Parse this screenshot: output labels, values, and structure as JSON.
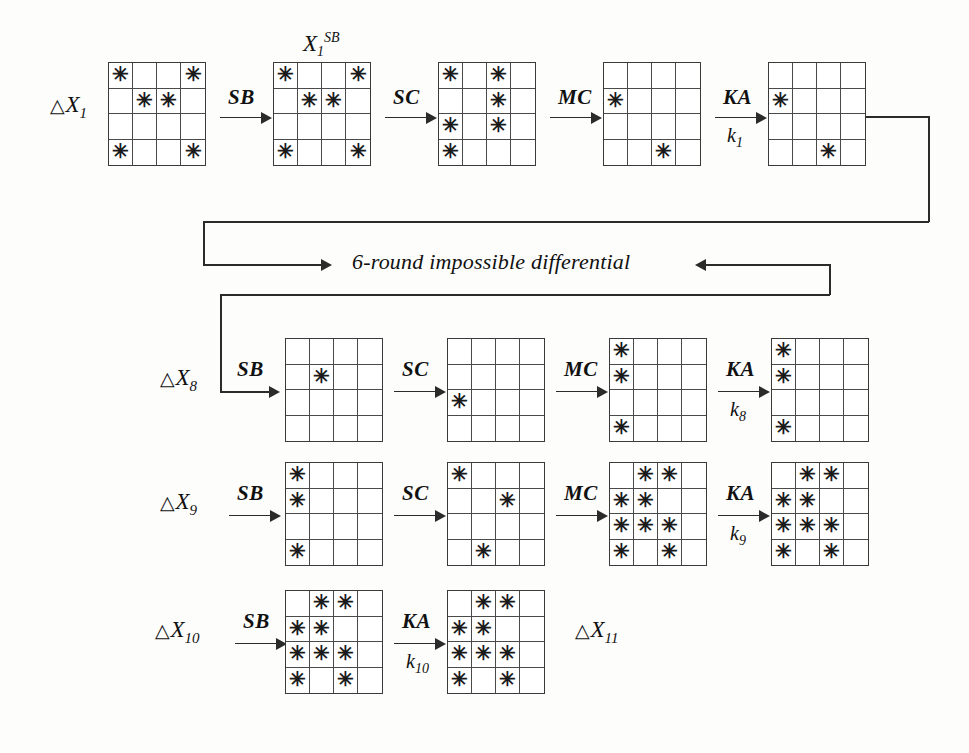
{
  "diagram": {
    "star_glyph": "✳",
    "middle_note": "6-round impossible differential",
    "rows": [
      {
        "id": "row-1",
        "input_label": {
          "delta": "△",
          "base": "X",
          "sub": "1"
        },
        "grid_label": {
          "base": "X",
          "sub": "1",
          "sup": "SB"
        },
        "steps": [
          {
            "op": "SB",
            "key": ""
          },
          {
            "op": "SC",
            "key": ""
          },
          {
            "op": "MC",
            "key": ""
          },
          {
            "op": "KA",
            "key": "k",
            "key_sub": "1"
          }
        ],
        "grids": [
          {
            "name": "grid-dx1",
            "cells": [
              1,
              0,
              0,
              1,
              0,
              1,
              1,
              0,
              0,
              0,
              0,
              0,
              1,
              0,
              0,
              1
            ]
          },
          {
            "name": "grid-x1sb",
            "cells": [
              1,
              0,
              0,
              1,
              0,
              1,
              1,
              0,
              0,
              0,
              0,
              0,
              1,
              0,
              0,
              1
            ]
          },
          {
            "name": "grid-r1-sc",
            "cells": [
              1,
              0,
              1,
              0,
              0,
              0,
              1,
              0,
              1,
              0,
              1,
              0,
              1,
              0,
              0,
              0
            ]
          },
          {
            "name": "grid-r1-mc",
            "cells": [
              0,
              0,
              0,
              0,
              1,
              0,
              0,
              0,
              0,
              0,
              0,
              0,
              0,
              0,
              1,
              0
            ]
          },
          {
            "name": "grid-r1-ka",
            "cells": [
              0,
              0,
              0,
              0,
              1,
              0,
              0,
              0,
              0,
              0,
              0,
              0,
              0,
              0,
              1,
              0
            ]
          }
        ]
      },
      {
        "id": "row-8",
        "input_label": {
          "delta": "△",
          "base": "X",
          "sub": "8"
        },
        "grid_label": null,
        "steps": [
          {
            "op": "SB",
            "key": ""
          },
          {
            "op": "SC",
            "key": ""
          },
          {
            "op": "MC",
            "key": ""
          },
          {
            "op": "KA",
            "key": "k",
            "key_sub": "8"
          }
        ],
        "grids": [
          {
            "name": "grid-r8-sb",
            "cells": [
              0,
              0,
              0,
              0,
              0,
              1,
              0,
              0,
              0,
              0,
              0,
              0,
              0,
              0,
              0,
              0
            ]
          },
          {
            "name": "grid-r8-sc",
            "cells": [
              0,
              0,
              0,
              0,
              0,
              0,
              0,
              0,
              1,
              0,
              0,
              0,
              0,
              0,
              0,
              0
            ]
          },
          {
            "name": "grid-r8-mc",
            "cells": [
              1,
              0,
              0,
              0,
              1,
              0,
              0,
              0,
              0,
              0,
              0,
              0,
              1,
              0,
              0,
              0
            ]
          },
          {
            "name": "grid-r8-ka",
            "cells": [
              1,
              0,
              0,
              0,
              1,
              0,
              0,
              0,
              0,
              0,
              0,
              0,
              1,
              0,
              0,
              0
            ]
          }
        ]
      },
      {
        "id": "row-9",
        "input_label": {
          "delta": "△",
          "base": "X",
          "sub": "9"
        },
        "grid_label": null,
        "steps": [
          {
            "op": "SB",
            "key": ""
          },
          {
            "op": "SC",
            "key": ""
          },
          {
            "op": "MC",
            "key": ""
          },
          {
            "op": "KA",
            "key": "k",
            "key_sub": "9"
          }
        ],
        "grids": [
          {
            "name": "grid-r9-sb",
            "cells": [
              1,
              0,
              0,
              0,
              1,
              0,
              0,
              0,
              0,
              0,
              0,
              0,
              1,
              0,
              0,
              0
            ]
          },
          {
            "name": "grid-r9-sc",
            "cells": [
              1,
              0,
              0,
              0,
              0,
              0,
              1,
              0,
              0,
              0,
              0,
              0,
              0,
              1,
              0,
              0
            ]
          },
          {
            "name": "grid-r9-mc",
            "cells": [
              0,
              1,
              1,
              0,
              1,
              1,
              0,
              0,
              1,
              1,
              1,
              0,
              1,
              0,
              1,
              0
            ]
          },
          {
            "name": "grid-r9-ka",
            "cells": [
              0,
              1,
              1,
              0,
              1,
              1,
              0,
              0,
              1,
              1,
              1,
              0,
              1,
              0,
              1,
              0
            ]
          }
        ]
      },
      {
        "id": "row-10",
        "input_label": {
          "delta": "△",
          "base": "X",
          "sub": "10"
        },
        "grid_label": null,
        "output_label": {
          "delta": "△",
          "base": "X",
          "sub": "11"
        },
        "steps": [
          {
            "op": "SB",
            "key": ""
          },
          {
            "op": "KA",
            "key": "k",
            "key_sub": "10"
          }
        ],
        "grids": [
          {
            "name": "grid-r10-sb",
            "cells": [
              0,
              1,
              1,
              0,
              1,
              1,
              0,
              0,
              1,
              1,
              1,
              0,
              1,
              0,
              1,
              0
            ]
          },
          {
            "name": "grid-r10-ka",
            "cells": [
              0,
              1,
              1,
              0,
              1,
              1,
              0,
              0,
              1,
              1,
              1,
              0,
              1,
              0,
              1,
              0
            ]
          }
        ]
      }
    ]
  }
}
